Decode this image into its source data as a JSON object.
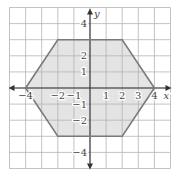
{
  "figure": {
    "x_axis_label": "x",
    "y_axis_label": "y",
    "x_tick_labels": [
      {
        "value": -4,
        "text": "−4"
      },
      {
        "value": -2,
        "text": "−2"
      },
      {
        "value": -1,
        "text": "−1"
      },
      {
        "value": 1,
        "text": "1"
      },
      {
        "value": 2,
        "text": "2"
      },
      {
        "value": 3,
        "text": "3"
      },
      {
        "value": 4,
        "text": "4"
      }
    ],
    "y_tick_labels": [
      {
        "value": 4,
        "text": "4"
      },
      {
        "value": 2,
        "text": "2"
      },
      {
        "value": 1,
        "text": "1"
      },
      {
        "value": -1,
        "text": "−1"
      },
      {
        "value": -2,
        "text": "−2"
      },
      {
        "value": -4,
        "text": "−4"
      }
    ],
    "grid": {
      "xmin": -5,
      "xmax": 5,
      "ymin": -5,
      "ymax": 5,
      "step": 1
    },
    "polygon": {
      "shape": "hexagon",
      "vertices": [
        [
          -4,
          0
        ],
        [
          -2,
          3
        ],
        [
          2,
          3
        ],
        [
          4,
          0
        ],
        [
          2,
          -3
        ],
        [
          -2,
          -3
        ]
      ]
    },
    "colors": {
      "grid": "#b4b4b4",
      "axes": "#333333",
      "fill": "#e4e4e4",
      "outline": "#7a7a7a"
    }
  }
}
